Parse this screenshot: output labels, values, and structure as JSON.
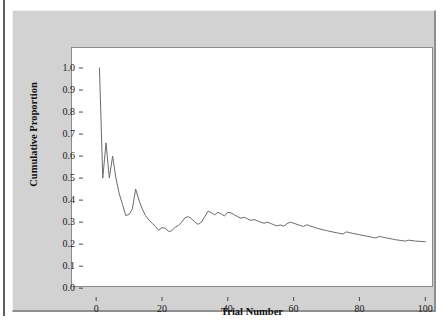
{
  "chart_data": {
    "type": "line",
    "title": "",
    "xlabel": "Trial Number",
    "ylabel": "Cumulative Proportion",
    "xlim": [
      -4,
      106
    ],
    "ylim": [
      -0.04,
      1.05
    ],
    "grid": false,
    "legend": false,
    "legend_position": "none",
    "line_color": "#6b6b6b",
    "xticks": [
      0,
      20,
      40,
      60,
      80,
      100
    ],
    "xtick_labels": [
      "0",
      "20",
      "40",
      "60",
      "80",
      "100"
    ],
    "yticks": [
      0.0,
      0.1,
      0.2,
      0.3,
      0.4,
      0.5,
      0.6,
      0.7,
      0.8,
      0.9,
      1.0
    ],
    "ytick_labels": [
      "0.0",
      "0.1",
      "0.2",
      "0.3",
      "0.4",
      "0.5",
      "0.6",
      "0.7",
      "0.8",
      "0.9",
      "1.0"
    ],
    "series": [
      {
        "name": "Cumulative Proportion",
        "x": [
          1,
          2,
          3,
          4,
          5,
          6,
          7,
          8,
          9,
          10,
          11,
          12,
          13,
          14,
          15,
          16,
          17,
          18,
          19,
          20,
          21,
          22,
          23,
          24,
          25,
          26,
          27,
          28,
          29,
          30,
          31,
          32,
          33,
          34,
          35,
          36,
          37,
          38,
          39,
          40,
          41,
          42,
          43,
          44,
          45,
          46,
          47,
          48,
          49,
          50,
          51,
          52,
          53,
          54,
          55,
          56,
          57,
          58,
          59,
          60,
          61,
          62,
          63,
          64,
          65,
          66,
          67,
          68,
          69,
          70,
          71,
          72,
          73,
          74,
          75,
          76,
          77,
          78,
          79,
          80,
          81,
          82,
          83,
          84,
          85,
          86,
          87,
          88,
          89,
          90,
          91,
          92,
          93,
          94,
          95,
          96,
          97,
          98,
          99,
          100
        ],
        "values": [
          1.0,
          0.5,
          0.66,
          0.5,
          0.6,
          0.5,
          0.43,
          0.38,
          0.33,
          0.335,
          0.36,
          0.45,
          0.4,
          0.36,
          0.33,
          0.31,
          0.295,
          0.28,
          0.263,
          0.275,
          0.272,
          0.258,
          0.261,
          0.277,
          0.285,
          0.3,
          0.32,
          0.325,
          0.315,
          0.3,
          0.29,
          0.3,
          0.325,
          0.35,
          0.343,
          0.333,
          0.345,
          0.337,
          0.328,
          0.345,
          0.342,
          0.333,
          0.325,
          0.318,
          0.322,
          0.315,
          0.308,
          0.312,
          0.306,
          0.3,
          0.295,
          0.3,
          0.294,
          0.288,
          0.283,
          0.287,
          0.282,
          0.293,
          0.3,
          0.295,
          0.29,
          0.285,
          0.28,
          0.288,
          0.283,
          0.278,
          0.273,
          0.269,
          0.265,
          0.262,
          0.258,
          0.255,
          0.252,
          0.249,
          0.246,
          0.256,
          0.252,
          0.249,
          0.246,
          0.243,
          0.24,
          0.237,
          0.234,
          0.231,
          0.228,
          0.235,
          0.232,
          0.229,
          0.226,
          0.223,
          0.22,
          0.218,
          0.216,
          0.214,
          0.218,
          0.216,
          0.214,
          0.213,
          0.212,
          0.211
        ]
      }
    ]
  }
}
